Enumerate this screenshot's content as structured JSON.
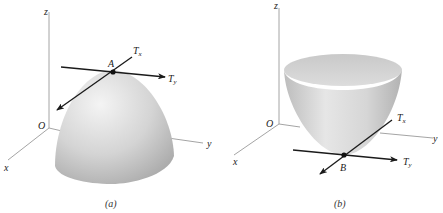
{
  "figure": {
    "panels": [
      {
        "id": "a",
        "caption": "(a)",
        "surface": "downward-opening paraboloid (dome)",
        "axes": {
          "z": "z",
          "y": "y",
          "x": "x",
          "origin": "O"
        },
        "point": "A",
        "tangents": {
          "x": "T",
          "x_sub": "x",
          "y": "T",
          "y_sub": "y"
        }
      },
      {
        "id": "b",
        "caption": "(b)",
        "surface": "upward-opening paraboloid (bowl)",
        "axes": {
          "z": "z",
          "y": "y",
          "x": "x",
          "origin": "O"
        },
        "point": "B",
        "tangents": {
          "x": "T",
          "x_sub": "x",
          "y": "T",
          "y_sub": "y"
        }
      }
    ]
  },
  "colors": {
    "surface_light": "#efefef",
    "surface_mid": "#cfcfcf",
    "surface_dark": "#a8a8a8",
    "axis": "#9a9a9a",
    "tangent": "#1a1a1a"
  }
}
